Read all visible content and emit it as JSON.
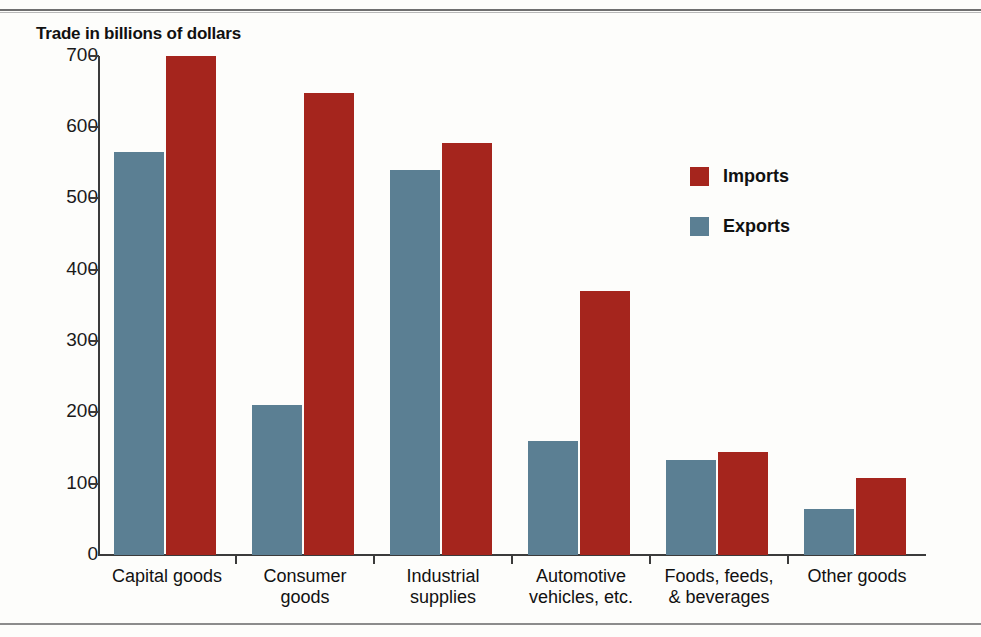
{
  "chart_data": {
    "type": "bar",
    "title": "Trade in billions of dollars",
    "xlabel": "",
    "ylabel": "Trade in billions of dollars",
    "ylim": [
      0,
      700
    ],
    "yticks": [
      0,
      100,
      200,
      300,
      400,
      500,
      600,
      700
    ],
    "ytick_labels": [
      "0",
      "100",
      "200",
      "300",
      "400",
      "500",
      "600",
      "700"
    ],
    "grid": false,
    "legend_position": "upper right inside",
    "categories": [
      "Capital goods",
      "Consumer\ngoods",
      "Industrial\nsupplies",
      "Automotive\nvehicles, etc.",
      "Foods, feeds,\n& beverages",
      "Other goods"
    ],
    "series": [
      {
        "name": "Exports",
        "color": "#5b7f93",
        "values": [
          565,
          210,
          540,
          160,
          133,
          65
        ]
      },
      {
        "name": "Imports",
        "color": "#a5251d",
        "values": [
          700,
          648,
          578,
          370,
          145,
          108
        ]
      }
    ]
  },
  "legend": {
    "items": [
      {
        "label": "Imports",
        "color": "#a5251d"
      },
      {
        "label": "Exports",
        "color": "#5b7f93"
      }
    ]
  }
}
